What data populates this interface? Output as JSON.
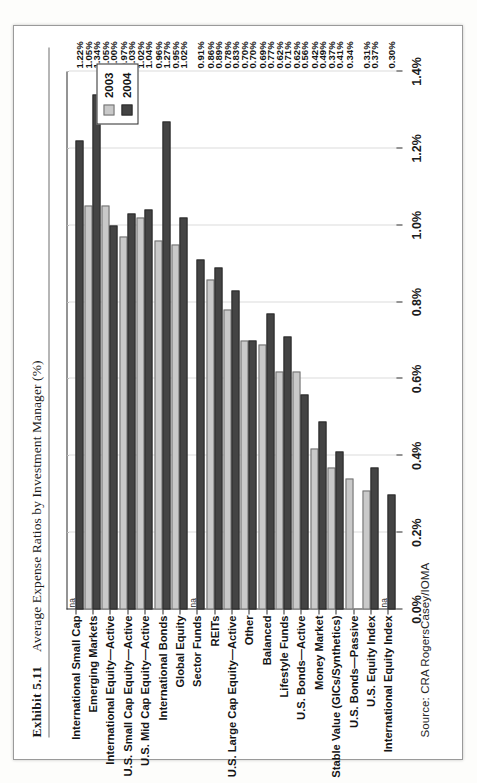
{
  "exhibit": {
    "number": "Exhibit 5.11",
    "title": "Average Expense Ratios by Investment Manager (%)"
  },
  "source": "Source: CRA RogersCasey/IOMA",
  "legend": {
    "items": [
      {
        "label": "2003",
        "color": "#c9c9c9"
      },
      {
        "label": "2004",
        "color": "#444444"
      }
    ]
  },
  "axis": {
    "ticks": [
      "0.0%",
      "0.2%",
      "0.4%",
      "0.6%",
      "0.8%",
      "1.0%",
      "1.2%",
      "1.4%"
    ],
    "na_text": "na"
  },
  "chart_data": {
    "type": "bar",
    "orientation": "horizontal",
    "title": "Average Expense Ratios by Investment Manager (%)",
    "xlabel": "",
    "ylabel": "",
    "xlim": [
      0.0,
      1.4
    ],
    "xtick_step": 0.2,
    "grid": true,
    "legend_position": "top-right",
    "categories": [
      "International Small Cap",
      "Emerging Markets",
      "International Equity—Active",
      "U.S. Small Cap Equity—Active",
      "U.S. Mid Cap Equity—Active",
      "International Bonds",
      "Global Equity",
      "Sector Funds",
      "REITs",
      "U.S. Large Cap Equity—Active",
      "Other",
      "Balanced",
      "Lifestyle Funds",
      "U.S. Bonds—Active",
      "Money Market",
      "Stable Value (GICs/Synthetics)",
      "U.S. Bonds—Passive",
      "U.S. Equity Index",
      "International Equity Index"
    ],
    "series": [
      {
        "name": "2003",
        "color": "#c9c9c9",
        "values": [
          null,
          1.05,
          1.05,
          0.97,
          1.02,
          0.96,
          0.95,
          null,
          0.86,
          0.78,
          0.7,
          0.69,
          0.62,
          0.62,
          0.42,
          0.37,
          0.34,
          0.31,
          null
        ],
        "labels": [
          "na",
          "1.05%",
          "1.05%",
          "0.97%",
          "1.02%",
          "0.96%",
          "0.95%",
          "na",
          "0.86%",
          "0.78%",
          "0.70%",
          "0.69%",
          "0.62%",
          "0.62%",
          "0.42%",
          "0.37%",
          "0.34%",
          "0.31%",
          "na"
        ]
      },
      {
        "name": "2004",
        "color": "#444444",
        "values": [
          1.22,
          1.34,
          1.0,
          1.03,
          1.04,
          1.27,
          1.02,
          0.91,
          0.89,
          0.83,
          0.7,
          0.77,
          0.71,
          0.56,
          0.49,
          0.41,
          null,
          0.37,
          0.3
        ],
        "labels": [
          "1.22%",
          "1.34%",
          "1.00%",
          "1.03%",
          "1.04%",
          "1.27%",
          "1.02%",
          "0.91%",
          "0.89%",
          "0.83%",
          "0.70%",
          "0.77%",
          "0.71%",
          "0.56%",
          "0.49%",
          "0.41%",
          "",
          "0.37%",
          "0.30%"
        ]
      }
    ]
  }
}
